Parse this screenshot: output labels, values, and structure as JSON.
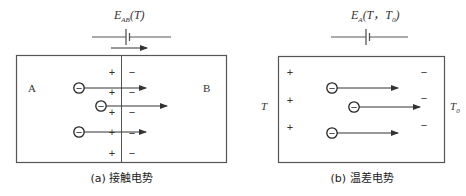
{
  "colors": {
    "line": "#555555",
    "text": "#333333",
    "background": "#ffffff"
  },
  "panel_a": {
    "emf_label_main": "E",
    "emf_label_sub": "AB",
    "emf_label_arg": "(T)",
    "region_left_label": "A",
    "region_right_label": "B",
    "plus_sign": "+",
    "minus_sign": "−",
    "electron_sign": "−",
    "caption": "(a) 接触电势"
  },
  "panel_b": {
    "emf_label_main": "E",
    "emf_label_sub": "A",
    "emf_label_arg_open": "(T，T",
    "emf_label_arg_sub": "0",
    "emf_label_arg_close": ")",
    "hot_end_label": "T",
    "cold_end_label_main": "T",
    "cold_end_label_sub": "0",
    "plus_sign": "+",
    "minus_sign": "−",
    "electron_sign": "−",
    "caption": "(b) 温差电势"
  }
}
